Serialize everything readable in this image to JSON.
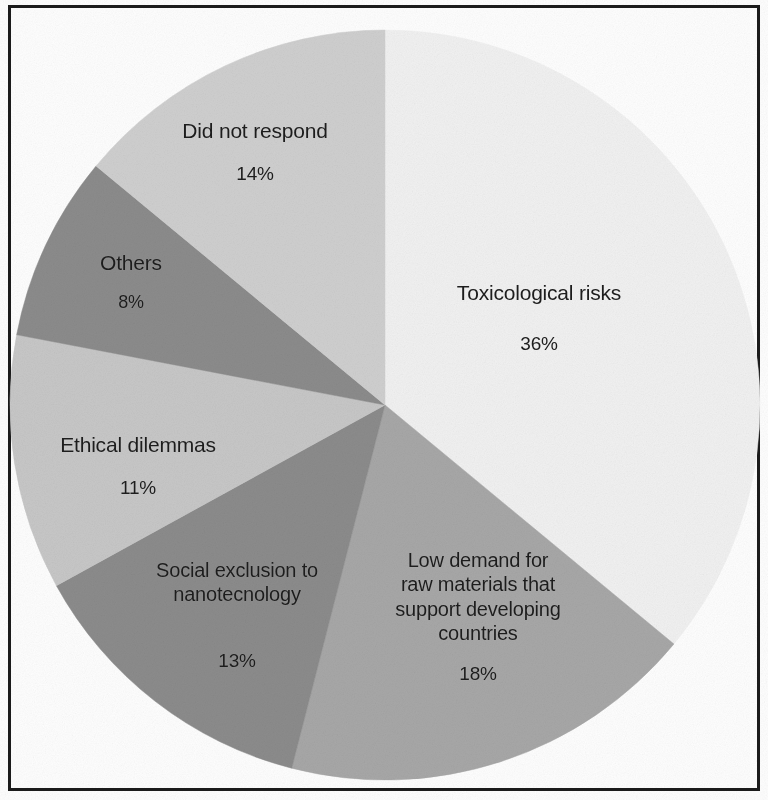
{
  "figure": {
    "background_color": "#ffffff",
    "frame_color": "#1b1b1b",
    "label_text_color": "#1d1d1d"
  },
  "chart_data": {
    "type": "pie",
    "title": "",
    "subtitle": "",
    "xlabel": "",
    "ylabel": "",
    "legend_position": "none",
    "grid": false,
    "value_unit": "%",
    "start_angle_deg": 0,
    "direction": "clockwise",
    "categories": [
      "Toxicological risks",
      "Low demand for raw materials that support developing countries",
      "Social exclusion to nanotecnology",
      "Ethical dilemmas",
      "Others",
      "Did not respond"
    ],
    "values": [
      36,
      18,
      13,
      11,
      8,
      14
    ],
    "slices": [
      {
        "label": "Toxicological risks",
        "label_display": "Toxicological risks",
        "value": 36,
        "percent_text": "36%",
        "color": "#f2f2f2",
        "start_deg": 0,
        "end_deg": 129.6
      },
      {
        "label": "Low demand for raw materials that support developing countries",
        "label_display": "Low demand for\nraw materials that\nsupport developing\ncountries",
        "value": 18,
        "percent_text": "18%",
        "color": "#a8a8a8",
        "start_deg": 129.6,
        "end_deg": 194.4
      },
      {
        "label": "Social exclusion to nanotecnology",
        "label_display": "Social exclusion to\nnanotecnology",
        "value": 13,
        "percent_text": "13%",
        "color": "#8c8c8c",
        "start_deg": 194.4,
        "end_deg": 241.2
      },
      {
        "label": "Ethical dilemmas",
        "label_display": "Ethical dilemmas",
        "value": 11,
        "percent_text": "11%",
        "color": "#c8c8c8",
        "start_deg": 241.2,
        "end_deg": 280.8
      },
      {
        "label": "Others",
        "label_display": "Others",
        "value": 8,
        "percent_text": "8%",
        "color": "#8c8c8c",
        "start_deg": 280.8,
        "end_deg": 309.6
      },
      {
        "label": "Did not respond",
        "label_display": "Did not respond",
        "value": 14,
        "percent_text": "14%",
        "color": "#d0d0d0",
        "start_deg": 309.6,
        "end_deg": 360
      }
    ],
    "geometry": {
      "center_x": 385,
      "center_y": 405,
      "radius": 375
    }
  }
}
